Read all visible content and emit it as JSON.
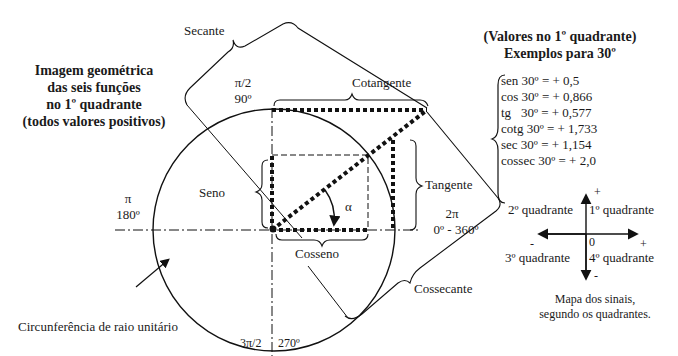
{
  "left_title": {
    "lines": [
      "Imagem geométrica",
      "das seis funções",
      "no 1º quadrante",
      "(todos valores positivos)"
    ]
  },
  "right_title": {
    "line1": "(Valores no 1º quadrante)",
    "line2": "Exemplos para 30º"
  },
  "values": [
    {
      "fn": "sen",
      "angle": "30º",
      "value": "= + 0,5"
    },
    {
      "fn": "cos",
      "angle": "30º",
      "value": "= + 0,866"
    },
    {
      "fn": "tg",
      "angle": "30º",
      "value": "= + 0,577"
    },
    {
      "fn": "cotg",
      "angle": "30º",
      "value": "= + 1,733"
    },
    {
      "fn": "sec",
      "angle": "30º",
      "value": "= + 1,154"
    },
    {
      "fn": "cossec",
      "angle": "30º",
      "value": "= + 2,0"
    }
  ],
  "labels": {
    "secante": "Secante",
    "cotangente": "Cotangente",
    "tangente": "Tangente",
    "seno": "Seno",
    "cosseno": "Cosseno",
    "cossecante": "Cossecante",
    "alpha": "α",
    "circle": "Circunferência de raio unitário"
  },
  "angles": {
    "pi_half": "π/2",
    "deg90": "90º",
    "pi": "π",
    "deg180": "180º",
    "two_pi": "2π",
    "deg0_360": "0º - 360º",
    "three_pi_half": "3π/2",
    "deg270": "270º"
  },
  "sign_map": {
    "q1": "1º quadrante",
    "q2": "2º quadrante",
    "q3": "3º quadrante",
    "q4": "4º quadrante",
    "origin": "0",
    "plus_y": "+",
    "minus_y": "-",
    "plus_x": "+",
    "minus_x": "-",
    "caption_line1": "Mapa dos sinais,",
    "caption_line2": "segundo os quadrantes."
  }
}
